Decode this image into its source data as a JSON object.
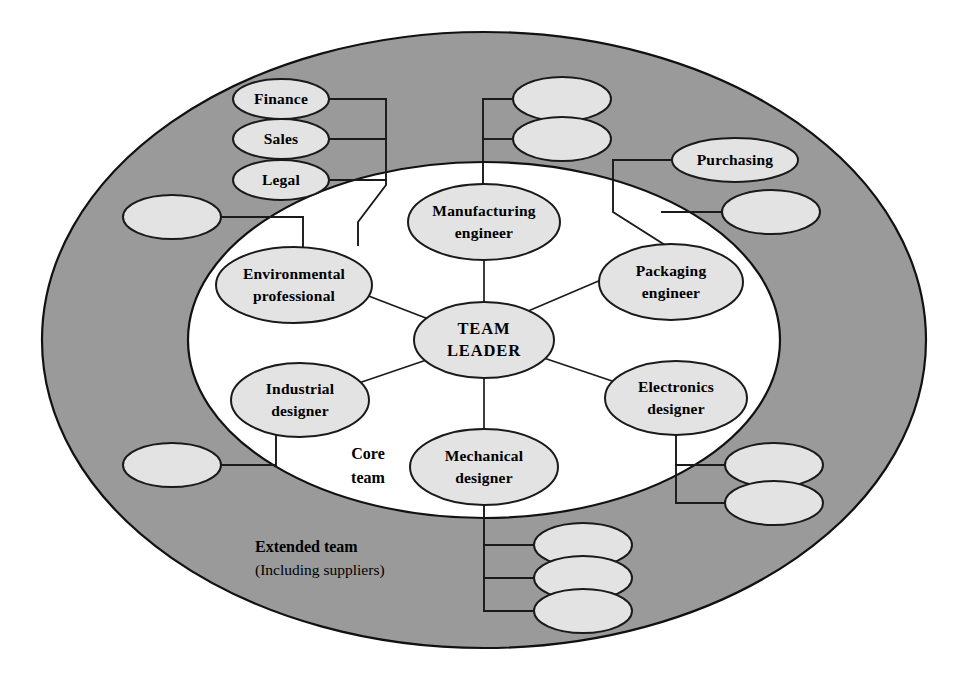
{
  "diagram": {
    "zones": {
      "core": {
        "line1": "Core",
        "line2": "team",
        "fill": "#ffffff"
      },
      "extended": {
        "line1": "Extended team",
        "line2": "(Including suppliers)",
        "fill": "#9a9a9a"
      }
    },
    "colors": {
      "ring_fill": "#9a9a9a",
      "core_fill": "#ffffff",
      "node_fill": "#e3e3e3",
      "stroke": "#1a1a1a",
      "text": "#000000"
    },
    "center": {
      "line1": "TEAM",
      "line2": "LEADER"
    },
    "core_nodes": [
      {
        "line1": "Manufacturing",
        "line2": "engineer"
      },
      {
        "line1": "Packaging",
        "line2": "engineer"
      },
      {
        "line1": "Electronics",
        "line2": "designer"
      },
      {
        "line1": "Mechanical",
        "line2": "designer"
      },
      {
        "line1": "Industrial",
        "line2": "designer"
      },
      {
        "line1": "Environmental",
        "line2": "professional"
      }
    ],
    "extended_nodes": [
      {
        "line1": "Finance",
        "line2": ""
      },
      {
        "line1": "Sales",
        "line2": ""
      },
      {
        "line1": "Legal",
        "line2": ""
      },
      {
        "line1": "Purchasing",
        "line2": ""
      },
      {
        "line1": "",
        "line2": ""
      },
      {
        "line1": "",
        "line2": ""
      },
      {
        "line1": "",
        "line2": ""
      },
      {
        "line1": "",
        "line2": ""
      },
      {
        "line1": "",
        "line2": ""
      },
      {
        "line1": "",
        "line2": ""
      },
      {
        "line1": "",
        "line2": ""
      },
      {
        "line1": "",
        "line2": ""
      },
      {
        "line1": "",
        "line2": ""
      },
      {
        "line1": "",
        "line2": ""
      }
    ]
  }
}
